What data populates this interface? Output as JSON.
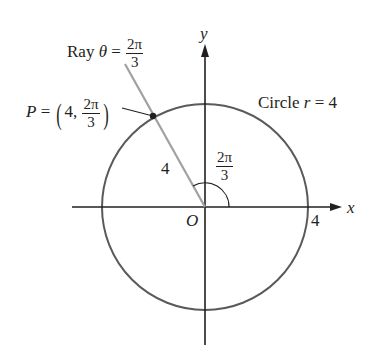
{
  "diagram": {
    "type": "polar-coordinate-plot",
    "axes": {
      "x_label": "x",
      "y_label": "y",
      "origin_label": "O",
      "x_tick_label": "4"
    },
    "circle": {
      "label_prefix": "Circle ",
      "label_var": "r",
      "label_eq": " = 4",
      "radius": "4"
    },
    "ray": {
      "label_prefix": "Ray ",
      "label_var": "θ",
      "label_eq": " = ",
      "angle_num": "2π",
      "angle_den": "3"
    },
    "point": {
      "name": "P",
      "eq": " = ",
      "r": "4,",
      "theta_num": "2π",
      "theta_den": "3"
    },
    "segment_label": "4",
    "angle_label": {
      "num": "2π",
      "den": "3"
    },
    "colors": {
      "axis": "#231f20",
      "circle": "#5a5a5a",
      "ray": "#a0a0a0",
      "point": "#231f20"
    }
  }
}
